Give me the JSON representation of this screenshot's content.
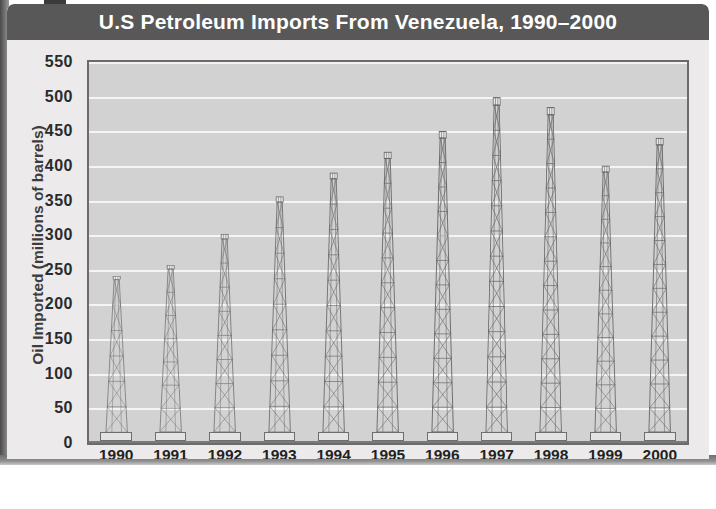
{
  "header": {
    "title": "U.S Petroleum Imports From Venezuela, 1990–2000"
  },
  "colors": {
    "title_bar": "#585858",
    "title_text": "#ffffff",
    "plot_background": "#d2d2d2",
    "gridline": "#f4f4f4",
    "card_background": "#eceaea",
    "derrick_line": "#5e5e5e",
    "axis": "#6b6b6b"
  },
  "chart_data": {
    "type": "bar",
    "title": "U.S Petroleum Imports From Venezuela, 1990–2000",
    "xlabel": "Year",
    "ylabel": "Oil Imported (millions of barrels)",
    "categories": [
      "1990",
      "1991",
      "1992",
      "1993",
      "1994",
      "1995",
      "1996",
      "1997",
      "1998",
      "1999",
      "2000"
    ],
    "values": [
      240,
      255,
      300,
      355,
      390,
      420,
      450,
      500,
      485,
      400,
      440
    ],
    "ylim": [
      0,
      550
    ],
    "ytick_step": 50,
    "yticks": [
      "550",
      "500",
      "450",
      "400",
      "350",
      "300",
      "250",
      "200",
      "150",
      "100",
      "50",
      "0"
    ],
    "ytick_values": [
      550,
      500,
      450,
      400,
      350,
      300,
      250,
      200,
      150,
      100,
      50,
      0
    ],
    "grid": true,
    "legend": null,
    "bar_style": "oil-derrick-tower"
  }
}
